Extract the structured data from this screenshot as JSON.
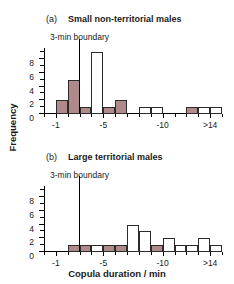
{
  "figure": {
    "ylabel": "Frequency",
    "xlabel": "Copula duration / min",
    "bar_fill_color": "#b08a8a",
    "bar_empty_color": "#ffffff",
    "bar_edge_color": "#2b2b2b",
    "boundary_color": "#000000"
  },
  "panels": [
    {
      "tag": "(a)",
      "title": "Small non-territorial males",
      "boundary_label": "3-min boundary"
    },
    {
      "tag": "(b)",
      "title": "Large territorial males",
      "boundary_label": "3-min boundary"
    }
  ],
  "axis": {
    "y_ticks_major": [
      0,
      2,
      4,
      6,
      8
    ],
    "y_ticks_minor": [
      1,
      3,
      5,
      7,
      9
    ],
    "y_tick_labels": [
      "0",
      "2",
      "4",
      "6",
      "8"
    ],
    "ylim": [
      0,
      9.6
    ],
    "x_ticks_major": [
      1,
      5,
      10,
      14
    ],
    "x_tick_labels": [
      "-1",
      "-5",
      "-10",
      ">14"
    ],
    "xlim": [
      0,
      15
    ]
  },
  "chart_data": [
    {
      "type": "bar",
      "title": "Small non-territorial males",
      "xlabel": "Copula duration / min",
      "ylabel": "Frequency",
      "xlim": [
        0,
        15
      ],
      "ylim": [
        0,
        9.6
      ],
      "grid": false,
      "legend": "none",
      "bin_width": 1,
      "annotations": [
        {
          "text": "3-min boundary",
          "x": 3,
          "type": "vertical-line"
        }
      ],
      "categories": [
        "0-1",
        "1-2",
        "2-3",
        "3-4",
        "4-5",
        "5-6",
        "6-7",
        "7-8",
        "8-9",
        "9-10",
        "10-11",
        "11-12",
        "12-13",
        "13-14",
        ">14"
      ],
      "x": [
        0.5,
        1.5,
        2.5,
        3.5,
        4.5,
        5.5,
        6.5,
        7.5,
        8.5,
        9.5,
        10.5,
        11.5,
        12.5,
        13.5,
        14.5
      ],
      "values": [
        0,
        2,
        5,
        1,
        9,
        1,
        2,
        0,
        1,
        1,
        0,
        0,
        1,
        1,
        1
      ],
      "filled": [
        false,
        true,
        true,
        true,
        false,
        true,
        true,
        false,
        false,
        false,
        false,
        false,
        true,
        false,
        false
      ]
    },
    {
      "type": "bar",
      "title": "Large territorial males",
      "xlabel": "Copula duration / min",
      "ylabel": "Frequency",
      "xlim": [
        0,
        15
      ],
      "ylim": [
        0,
        9.6
      ],
      "grid": false,
      "legend": "none",
      "bin_width": 1,
      "annotations": [
        {
          "text": "3-min boundary",
          "x": 3,
          "type": "vertical-line"
        }
      ],
      "categories": [
        "0-1",
        "1-2",
        "2-3",
        "3-4",
        "4-5",
        "5-6",
        "6-7",
        "7-8",
        "8-9",
        "9-10",
        "10-11",
        "11-12",
        "12-13",
        "13-14",
        ">14"
      ],
      "x": [
        0.5,
        1.5,
        2.5,
        3.5,
        4.5,
        5.5,
        6.5,
        7.5,
        8.5,
        9.5,
        10.5,
        11.5,
        12.5,
        13.5,
        14.5
      ],
      "values": [
        0,
        0,
        1,
        1,
        1,
        1,
        1,
        4,
        3,
        1,
        2,
        1,
        1,
        2,
        1
      ],
      "filled": [
        false,
        false,
        true,
        true,
        false,
        true,
        true,
        false,
        false,
        true,
        false,
        false,
        false,
        false,
        false
      ]
    }
  ]
}
